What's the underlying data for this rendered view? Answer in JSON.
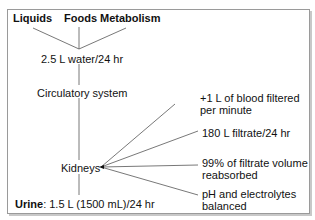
{
  "diagram": {
    "sources": [
      {
        "label": "Liquids"
      },
      {
        "label": "Foods"
      },
      {
        "label": "Metabolism"
      }
    ],
    "intake": "2.5 L water/24 hr",
    "circulatory": "Circulatory system",
    "kidneys": "Kidneys",
    "kidney_facts": [
      {
        "line1": "+1 L of blood filtered",
        "line2": "per minute"
      },
      {
        "line1": "180 L filtrate/24 hr",
        "line2": ""
      },
      {
        "line1": "99% of filtrate volume",
        "line2": "reabsorbed"
      },
      {
        "line1": "pH and electrolytes",
        "line2": "balanced"
      }
    ],
    "output": {
      "label": "Urine",
      "value": ": 1.5 L (1500 mL)/24 hr"
    }
  }
}
